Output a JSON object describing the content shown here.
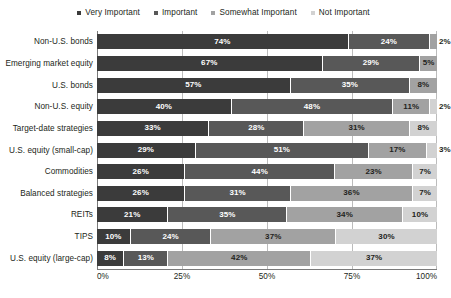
{
  "chart_data": {
    "type": "bar",
    "orientation": "horizontal",
    "stacked": true,
    "stack_mode": "percent",
    "title": "",
    "subtitle": "",
    "xlabel": "",
    "ylabel": "",
    "xlim": [
      0,
      100
    ],
    "xticks": [
      "0%",
      "25%",
      "50%",
      "75%",
      "100%"
    ],
    "xtick_values": [
      0,
      25,
      50,
      75,
      100
    ],
    "grid": true,
    "grid_axis": "x",
    "legend_position": "top-center",
    "value_suffix": "%",
    "categories": [
      "Non-U.S. bonds",
      "Emerging market equity",
      "U.S. bonds",
      "Non-U.S. equity",
      "Target-date strategies",
      "U.S. equity (small-cap)",
      "Commodities",
      "Balanced strategies",
      "REITs",
      "TIPS",
      "U.S. equity (large-cap)"
    ],
    "series": [
      {
        "name": "Very Important",
        "color": "#3b3b3b",
        "values": [
          74,
          67,
          57,
          40,
          33,
          29,
          26,
          26,
          21,
          10,
          8
        ]
      },
      {
        "name": "Important",
        "color": "#585858",
        "values": [
          24,
          29,
          35,
          48,
          28,
          51,
          44,
          31,
          35,
          24,
          13
        ]
      },
      {
        "name": "Somewhat Important",
        "color": "#a2a2a2",
        "values": [
          2,
          5,
          8,
          11,
          31,
          17,
          23,
          36,
          34,
          37,
          42
        ]
      },
      {
        "name": "Not Important",
        "color": "#d2d2d2",
        "values": [
          0,
          0,
          0,
          2,
          8,
          3,
          7,
          7,
          10,
          30,
          37
        ]
      }
    ],
    "data_labels": [
      [
        "74%",
        "24%",
        "2%",
        ""
      ],
      [
        "67%",
        "29%",
        "5%",
        ""
      ],
      [
        "57%",
        "35%",
        "8%",
        ""
      ],
      [
        "40%",
        "48%",
        "11%",
        "2%"
      ],
      [
        "33%",
        "28%",
        "31%",
        "8%"
      ],
      [
        "29%",
        "51%",
        "17%",
        "3%"
      ],
      [
        "26%",
        "44%",
        "23%",
        "7%"
      ],
      [
        "26%",
        "31%",
        "36%",
        "7%"
      ],
      [
        "21%",
        "35%",
        "34%",
        "10%"
      ],
      [
        "10%",
        "24%",
        "37%",
        "30%"
      ],
      [
        "8%",
        "13%",
        "42%",
        "37%"
      ]
    ]
  },
  "colors": {
    "very_important": "#3b3b3b",
    "important": "#585858",
    "somewhat_important": "#a2a2a2",
    "not_important": "#d2d2d2",
    "grid": "#bcbcbc",
    "axis": "#7a7a7a",
    "text": "#231f20",
    "background": "#ffffff"
  }
}
